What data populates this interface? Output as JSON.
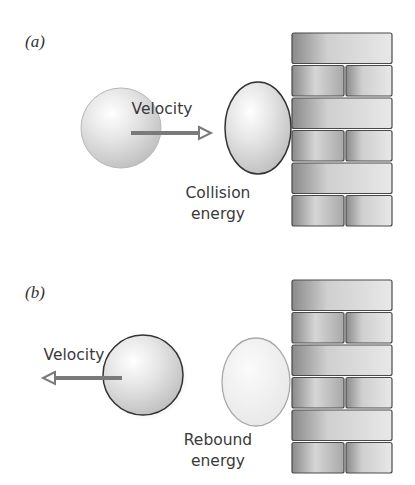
{
  "figure": {
    "panels": [
      {
        "label": "(a)",
        "velocity_label": "Velocity",
        "velocity_direction": "right",
        "energy_label_line1": "Collision",
        "energy_label_line2": "energy"
      },
      {
        "label": "(b)",
        "velocity_label": "Velocity",
        "velocity_direction": "left",
        "energy_label_line1": "Rebound",
        "energy_label_line2": "energy"
      }
    ],
    "colors": {
      "arrow": "#7a7a7a",
      "ball_outline": "#3a3a3a",
      "ghost_outline": "#9a9a9a",
      "brick_fill": "#bdbdbd",
      "mortar": "#555555"
    }
  }
}
